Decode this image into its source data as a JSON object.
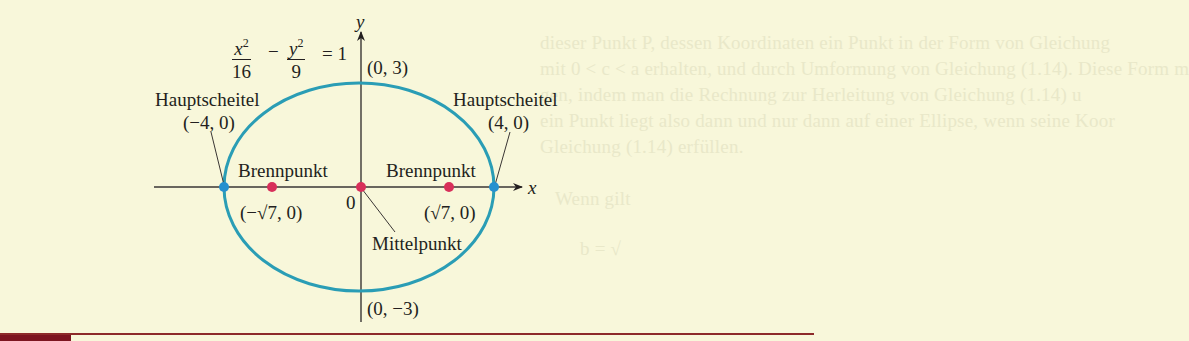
{
  "background_text": {
    "lines": [
      "dieser Punkt P, dessen Koordinaten ein Punkt in der Form von Gleichung",
      "mit 0 < c < a erhalten, und durch Umformung von Gleichung (1.14). Diese Form m",
      "gen, indem man die Rechnung zur Herleitung von Gleichung (1.14) u",
      "ein Punkt liegt also dann und nur dann auf einer Ellipse, wenn seine Koor",
      "Gleichung (1.14) erfüllen.",
      "Wenn gilt",
      "b = √"
    ]
  },
  "equation": {
    "x_num": "x",
    "x_exp": "2",
    "x_den": "16",
    "operator": "−",
    "y_num": "y",
    "y_exp": "2",
    "y_den": "9",
    "rhs": "= 1"
  },
  "axes": {
    "x_label": "x",
    "y_label": "y",
    "origin_label": "0"
  },
  "labels": {
    "vertex_left_title": "Hauptscheitel",
    "vertex_left_coord": "(−4, 0)",
    "vertex_right_title": "Hauptscheitel",
    "vertex_right_coord": "(4, 0)",
    "focus_left_title": "Brennpunkt",
    "focus_left_coord": "(−√7, 0)",
    "focus_right_title": "Brennpunkt",
    "focus_right_coord": "(√7, 0)",
    "center_title": "Mittelpunkt",
    "top_coord": "(0, 3)",
    "bottom_coord": "(0, −3)"
  },
  "colors": {
    "background": "#f8f7da",
    "ellipse": "#2a9db5",
    "vertex_dot": "#2690cf",
    "focus_dot": "#d8305a",
    "axis": "#3a3634",
    "bottom_bar": "#7c1520"
  },
  "geometry": {
    "a": 4,
    "b": 3,
    "c": "√7"
  }
}
